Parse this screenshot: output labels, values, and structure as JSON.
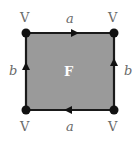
{
  "diagram": {
    "face_label": "F",
    "vertex_label": "V",
    "edges": {
      "top": {
        "label": "a",
        "direction": "right"
      },
      "bottom": {
        "label": "a",
        "direction": "left"
      },
      "left": {
        "label": "b",
        "direction": "up"
      },
      "right": {
        "label": "b",
        "direction": "up"
      }
    },
    "vertices": [
      "V",
      "V",
      "V",
      "V"
    ],
    "colors": {
      "face_fill": "#9a9a9a",
      "edge": "#1a1a1a",
      "vertex": "#111111",
      "label": "#6a6a6a",
      "face_label": "#ffffff"
    }
  }
}
